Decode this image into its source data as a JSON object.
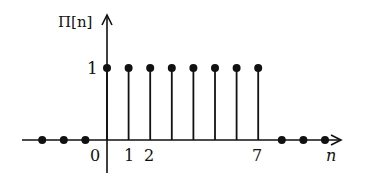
{
  "chart_data": {
    "type": "stem",
    "title": "",
    "ylabel": "Π[n]",
    "xlabel": "n",
    "x": [
      -3,
      -2,
      -1,
      0,
      1,
      2,
      3,
      4,
      5,
      6,
      7,
      8,
      9,
      10
    ],
    "values": [
      0,
      0,
      0,
      1,
      1,
      1,
      1,
      1,
      1,
      1,
      1,
      0,
      0,
      0
    ],
    "x_tick_labels": [
      "0",
      "1",
      "2",
      "7"
    ],
    "y_tick_labels": [
      "1"
    ],
    "xlim": [
      -3.5,
      11
    ],
    "ylim": [
      0,
      1.3
    ],
    "grid": false,
    "legend": null
  },
  "labels": {
    "y_axis": "Π[n]",
    "x_axis": "n",
    "y_one": "1",
    "x_zero": "0",
    "x_one": "1",
    "x_two": "2",
    "x_seven": "7"
  }
}
